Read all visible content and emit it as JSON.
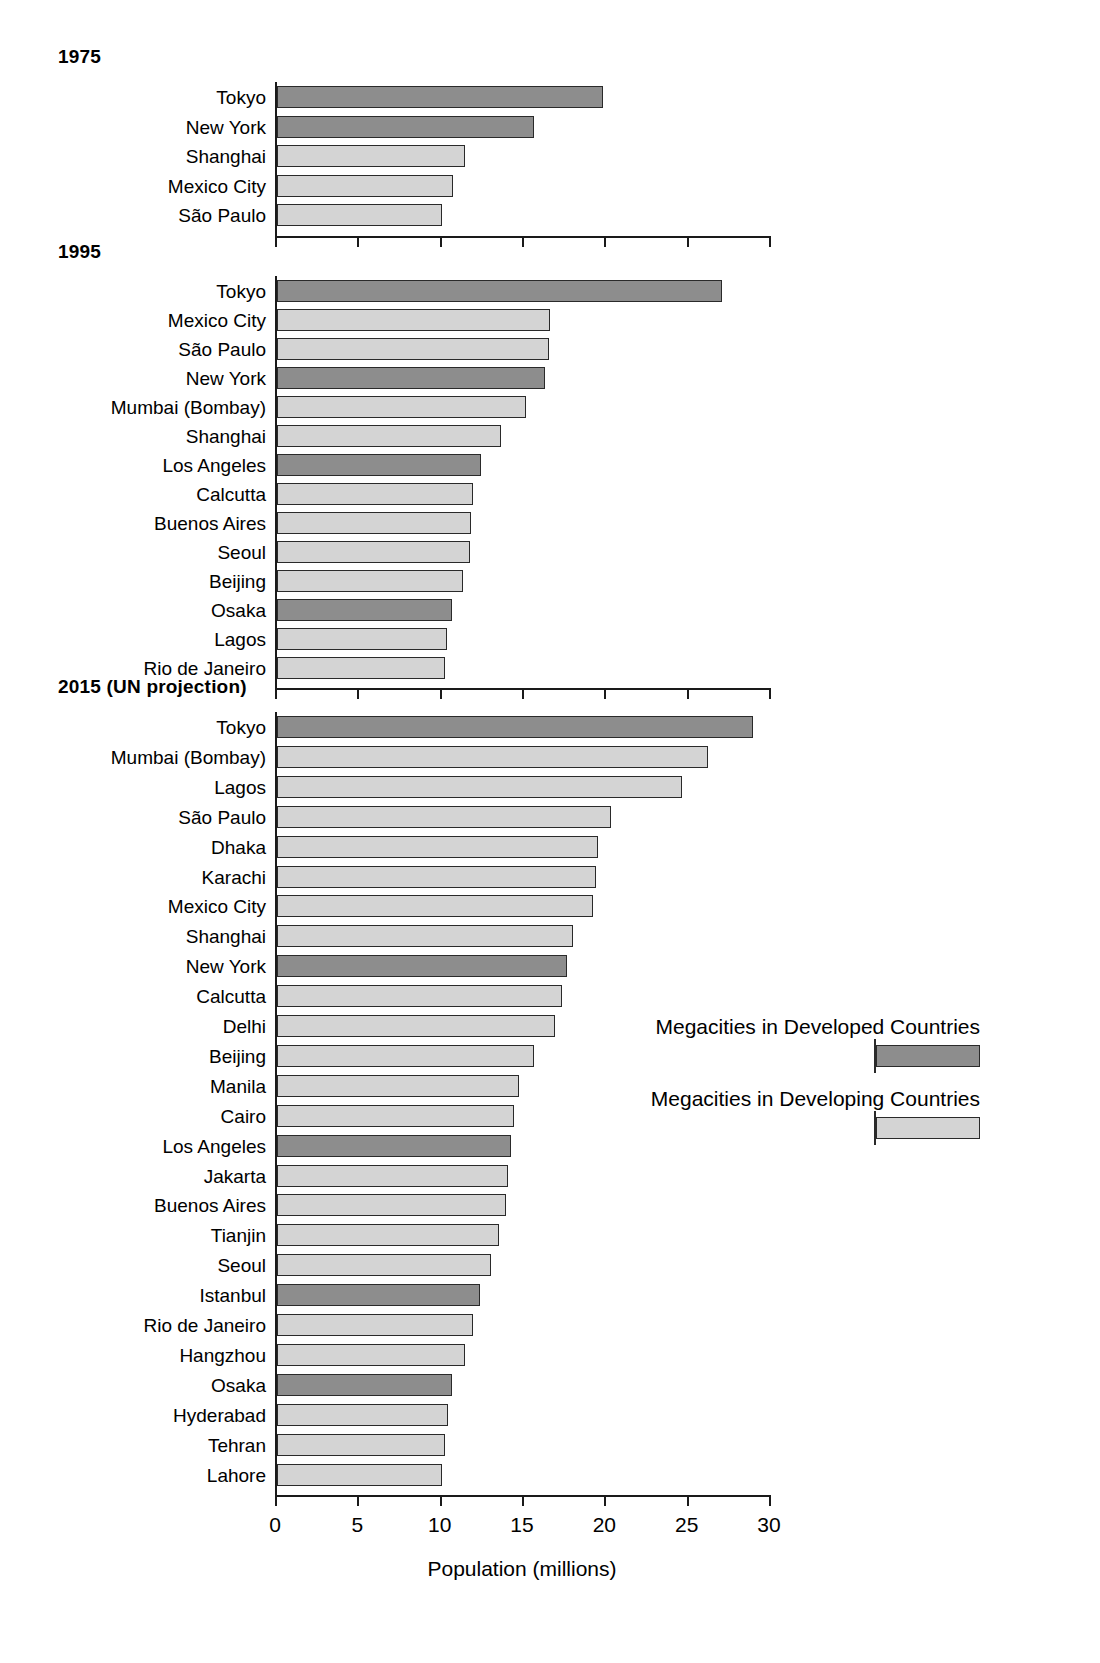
{
  "chart_data": {
    "type": "bar",
    "orientation": "horizontal",
    "title": "",
    "xlabel": "Population (millions)",
    "ylabel": "",
    "xlim": [
      0,
      30
    ],
    "xticks": [
      0,
      5,
      10,
      15,
      20,
      25,
      30
    ],
    "xticklabels": [
      "0",
      "5",
      "10",
      "15",
      "20",
      "25",
      "30"
    ],
    "grid": false,
    "legend": {
      "position": "middle-right",
      "entries": [
        {
          "name": "Megacities in Developed Countries",
          "color": "#8d8d8d",
          "key": "developed"
        },
        {
          "name": "Megacities in Developing Countries",
          "color": "#d4d4d4",
          "key": "developing"
        }
      ]
    },
    "panels": [
      {
        "title": "1975",
        "categories": [
          "Tokyo",
          "New York",
          "Shanghai",
          "Mexico City",
          "São Paulo"
        ],
        "values": [
          19.8,
          15.6,
          11.4,
          10.7,
          10.0
        ],
        "groups": [
          "developed",
          "developed",
          "developing",
          "developing",
          "developing"
        ]
      },
      {
        "title": "1995",
        "categories": [
          "Tokyo",
          "Mexico City",
          "São Paulo",
          "New York",
          "Mumbai (Bombay)",
          "Shanghai",
          "Los Angeles",
          "Calcutta",
          "Buenos Aires",
          "Seoul",
          "Beijing",
          "Osaka",
          "Lagos",
          "Rio de Janeiro"
        ],
        "values": [
          27.0,
          16.6,
          16.5,
          16.3,
          15.1,
          13.6,
          12.4,
          11.9,
          11.8,
          11.7,
          11.3,
          10.6,
          10.3,
          10.2
        ],
        "groups": [
          "developed",
          "developing",
          "developing",
          "developed",
          "developing",
          "developing",
          "developed",
          "developing",
          "developing",
          "developing",
          "developing",
          "developed",
          "developing",
          "developing"
        ]
      },
      {
        "title": "2015 (UN projection)",
        "categories": [
          "Tokyo",
          "Mumbai (Bombay)",
          "Lagos",
          "São Paulo",
          "Dhaka",
          "Karachi",
          "Mexico City",
          "Shanghai",
          "New York",
          "Calcutta",
          "Delhi",
          "Beijing",
          "Manila",
          "Cairo",
          "Los Angeles",
          "Jakarta",
          "Buenos Aires",
          "Tianjin",
          "Seoul",
          "Istanbul",
          "Rio de Janeiro",
          "Hangzhou",
          "Osaka",
          "Hyderabad",
          "Tehran",
          "Lahore"
        ],
        "values": [
          28.9,
          26.2,
          24.6,
          20.3,
          19.5,
          19.4,
          19.2,
          18.0,
          17.6,
          17.3,
          16.9,
          15.6,
          14.7,
          14.4,
          14.2,
          14.0,
          13.9,
          13.5,
          13.0,
          12.3,
          11.9,
          11.4,
          10.6,
          10.4,
          10.2,
          10.0
        ],
        "groups": [
          "developed",
          "developing",
          "developing",
          "developing",
          "developing",
          "developing",
          "developing",
          "developing",
          "developed",
          "developing",
          "developing",
          "developing",
          "developing",
          "developing",
          "developed",
          "developing",
          "developing",
          "developing",
          "developing",
          "developed",
          "developing",
          "developing",
          "developed",
          "developing",
          "developing",
          "developing"
        ]
      }
    ]
  }
}
